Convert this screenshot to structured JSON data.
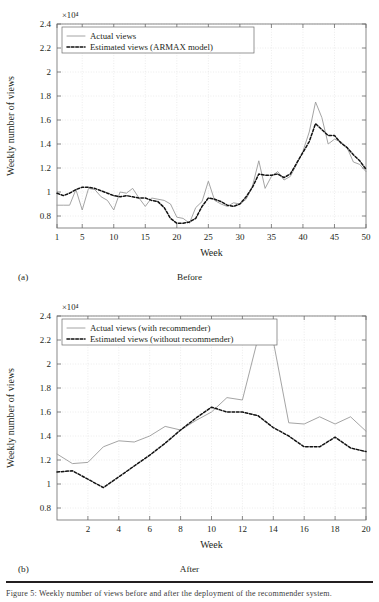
{
  "figure": {
    "bottom_caption_fragment": "Figure 5: Weekly number of views before and after the deployment of the recommender system."
  },
  "panels": [
    {
      "tag": "(a)",
      "caption": "Before",
      "axis_exponent": "×10⁴",
      "ylabel": "Weekly number of views",
      "xlabel": "Week",
      "yticks": [
        "0.8",
        "1",
        "1.2",
        "1.4",
        "1.6",
        "1.8",
        "2",
        "2.2",
        "2.4"
      ],
      "xticks": [
        "1",
        "5",
        "10",
        "15",
        "20",
        "25",
        "30",
        "35",
        "40",
        "45",
        "50"
      ],
      "legend": [
        {
          "label": "Actual views",
          "style": "solid",
          "color": "#9a9a9a"
        },
        {
          "label": "Estimated views (ARMAX model)",
          "style": "dashdot",
          "color": "#111111"
        }
      ]
    },
    {
      "tag": "(b)",
      "caption": "After",
      "axis_exponent": "×10⁴",
      "ylabel": "Weekly number of views",
      "xlabel": "Week",
      "yticks": [
        "0.8",
        "1",
        "1.2",
        "1.4",
        "1.6",
        "1.8",
        "2",
        "2.2",
        "2.4"
      ],
      "xticks": [
        "2",
        "4",
        "6",
        "8",
        "10",
        "12",
        "14",
        "16",
        "18",
        "20"
      ],
      "legend": [
        {
          "label": "Actual views (with recommender)",
          "style": "solid",
          "color": "#9a9a9a"
        },
        {
          "label": "Estimated views (without recommender)",
          "style": "dashdot",
          "color": "#111111"
        }
      ]
    }
  ],
  "chart_data": [
    {
      "type": "line",
      "title": "Before",
      "subtitle": "(a)",
      "xlabel": "Week",
      "ylabel": "Weekly number of views",
      "y_axis_exponent": 10000,
      "xlim": [
        1,
        50
      ],
      "ylim": [
        0.7,
        2.4
      ],
      "ytick_values": [
        0.8,
        1.0,
        1.2,
        1.4,
        1.6,
        1.8,
        2.0,
        2.2,
        2.4
      ],
      "xtick_values": [
        1,
        5,
        10,
        15,
        20,
        25,
        30,
        35,
        40,
        45,
        50
      ],
      "grid": true,
      "legend_position": "top-left",
      "x": [
        1,
        2,
        3,
        4,
        5,
        6,
        7,
        8,
        9,
        10,
        11,
        12,
        13,
        14,
        15,
        16,
        17,
        18,
        19,
        20,
        21,
        22,
        23,
        24,
        25,
        26,
        27,
        28,
        29,
        30,
        31,
        32,
        33,
        34,
        35,
        36,
        37,
        38,
        39,
        40,
        41,
        42,
        43,
        44,
        45,
        46,
        47,
        48,
        49,
        50
      ],
      "series": [
        {
          "name": "Actual views",
          "style": "solid",
          "color": "#9a9a9a",
          "values": [
            0.89,
            0.89,
            0.89,
            1.02,
            0.85,
            1.03,
            1.02,
            0.96,
            0.93,
            0.85,
            1.0,
            0.99,
            1.03,
            0.95,
            0.88,
            0.95,
            0.94,
            0.93,
            0.9,
            0.79,
            0.78,
            0.74,
            0.87,
            0.92,
            1.09,
            0.93,
            0.9,
            0.88,
            0.91,
            0.9,
            0.94,
            1.05,
            1.26,
            1.03,
            1.13,
            1.17,
            1.1,
            1.13,
            1.23,
            1.34,
            1.5,
            1.75,
            1.62,
            1.4,
            1.44,
            1.42,
            1.37,
            1.25,
            1.23,
            1.17
          ]
        },
        {
          "name": "Estimated views (ARMAX model)",
          "style": "dashdot",
          "color": "#111111",
          "values": [
            0.99,
            0.97,
            0.99,
            1.02,
            1.04,
            1.04,
            1.03,
            1.01,
            0.99,
            0.97,
            0.96,
            0.97,
            0.96,
            0.95,
            0.95,
            0.93,
            0.92,
            0.87,
            0.78,
            0.74,
            0.74,
            0.75,
            0.78,
            0.88,
            0.95,
            0.94,
            0.92,
            0.89,
            0.88,
            0.9,
            0.96,
            1.04,
            1.15,
            1.14,
            1.14,
            1.15,
            1.12,
            1.15,
            1.24,
            1.33,
            1.42,
            1.57,
            1.52,
            1.47,
            1.47,
            1.41,
            1.37,
            1.31,
            1.26,
            1.19
          ]
        }
      ]
    },
    {
      "type": "line",
      "title": "After",
      "subtitle": "(b)",
      "xlabel": "Week",
      "ylabel": "Weekly number of views",
      "y_axis_exponent": 10000,
      "xlim": [
        0,
        20
      ],
      "ylim": [
        0.7,
        2.4
      ],
      "ytick_values": [
        0.8,
        1.0,
        1.2,
        1.4,
        1.6,
        1.8,
        2.0,
        2.2,
        2.4
      ],
      "xtick_values": [
        2,
        4,
        6,
        8,
        10,
        12,
        14,
        16,
        18,
        20
      ],
      "grid": true,
      "legend_position": "top-left",
      "x": [
        0,
        1,
        2,
        3,
        4,
        5,
        6,
        7,
        8,
        9,
        10,
        11,
        12,
        13,
        14,
        15,
        16,
        17,
        18,
        19,
        20
      ],
      "series": [
        {
          "name": "Actual views (with recommender)",
          "style": "solid",
          "color": "#9a9a9a",
          "values": [
            1.25,
            1.17,
            1.18,
            1.31,
            1.36,
            1.35,
            1.4,
            1.48,
            1.45,
            1.53,
            1.6,
            1.72,
            1.7,
            2.21,
            2.19,
            1.51,
            1.5,
            1.56,
            1.5,
            1.56,
            1.44
          ]
        },
        {
          "name": "Estimated views (without recommender)",
          "style": "dashdot",
          "color": "#111111",
          "values": [
            1.1,
            1.11,
            1.04,
            0.97,
            1.06,
            1.15,
            1.24,
            1.34,
            1.45,
            1.55,
            1.64,
            1.6,
            1.6,
            1.57,
            1.47,
            1.4,
            1.31,
            1.31,
            1.39,
            1.3,
            1.27
          ]
        }
      ]
    }
  ]
}
